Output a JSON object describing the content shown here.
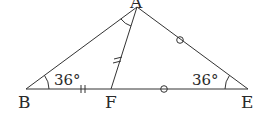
{
  "diagram": {
    "type": "geometry-triangle",
    "vertices": {
      "A": {
        "label": "A",
        "x": 137,
        "y": 7
      },
      "B": {
        "label": "B",
        "x": 26,
        "y": 89
      },
      "F": {
        "label": "F",
        "x": 111,
        "y": 89
      },
      "E": {
        "label": "E",
        "x": 248,
        "y": 89
      }
    },
    "segments": [
      "AB",
      "AE",
      "AF",
      "BE"
    ],
    "angles": {
      "B": {
        "label": "36°"
      },
      "E": {
        "label": "36°"
      },
      "BAF": {
        "label": ""
      }
    },
    "equal_marks": {
      "double_tick": [
        "BF",
        "AF"
      ],
      "circle": [
        "FE",
        "AE"
      ]
    }
  }
}
